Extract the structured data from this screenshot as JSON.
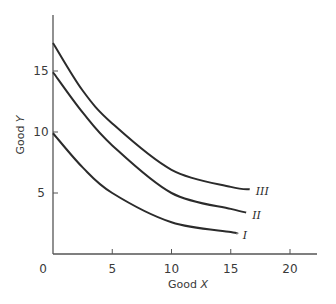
{
  "chart_data": {
    "type": "line",
    "title": "",
    "xlabel": "Good X",
    "ylabel": "Good Y",
    "xlabel_parts": [
      "Good ",
      "X"
    ],
    "ylabel_parts": [
      "Good ",
      "Y"
    ],
    "xlim": [
      0,
      22
    ],
    "ylim": [
      0,
      19
    ],
    "x_ticks": [
      0,
      5,
      10,
      15,
      20
    ],
    "x_tick_labels": [
      "0",
      "5",
      "10",
      "15",
      "20"
    ],
    "y_ticks": [
      5,
      10,
      15
    ],
    "y_tick_labels": [
      "5",
      "10",
      "15"
    ],
    "grid": false,
    "legend": "inline labels at curve ends",
    "series": [
      {
        "name": "I",
        "x": [
          0,
          2.5,
          5,
          10,
          15,
          15.5
        ],
        "y": [
          9.9,
          7.1,
          5.0,
          2.6,
          1.8,
          1.7
        ]
      },
      {
        "name": "II",
        "x": [
          0,
          2.5,
          5,
          10,
          15,
          16.3
        ],
        "y": [
          14.9,
          11.6,
          8.9,
          5.0,
          3.7,
          3.4
        ]
      },
      {
        "name": "III",
        "x": [
          0,
          2.5,
          5,
          10,
          15,
          16.6
        ],
        "y": [
          17.3,
          13.4,
          10.7,
          6.9,
          5.5,
          5.3
        ]
      }
    ]
  },
  "style": {
    "axis_color": "#555555",
    "curve_color": "#2b2b2b",
    "background": "#ffffff"
  }
}
